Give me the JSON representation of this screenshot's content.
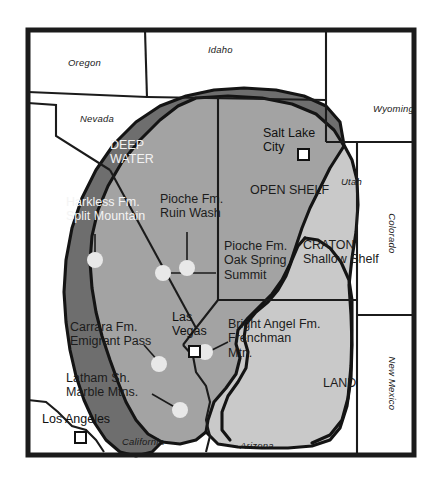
{
  "map": {
    "title": "Cambrian paleogeographic map of the southwestern United States",
    "frame": {
      "border_color": "#1b1b1b",
      "background": "#ffffff"
    },
    "colors": {
      "deep_water": "#6e6e6e",
      "open_shelf": "#a3a3a3",
      "craton_shallow_shelf": "#c9c9c9",
      "land": "#9a9a9a",
      "outline": "#141414",
      "dot_fill": "#e8e8e8",
      "state_line": "#1b1b1b",
      "paper": "#ffffff"
    },
    "states": [
      {
        "name": "Oregon",
        "orientation": "horizontal"
      },
      {
        "name": "Idaho",
        "orientation": "horizontal"
      },
      {
        "name": "Nevada",
        "orientation": "horizontal"
      },
      {
        "name": "Wyoming",
        "orientation": "horizontal"
      },
      {
        "name": "Utah",
        "orientation": "horizontal"
      },
      {
        "name": "Colorado",
        "orientation": "vertical"
      },
      {
        "name": "New Mexico",
        "orientation": "vertical"
      },
      {
        "name": "California",
        "orientation": "horizontal"
      },
      {
        "name": "Arizona",
        "orientation": "horizontal"
      }
    ],
    "facies_regions": [
      {
        "id": "deep-water",
        "label": "DEEP\nWATER",
        "text_color": "light"
      },
      {
        "id": "open-shelf",
        "label": "OPEN SHELF",
        "text_color": "dark"
      },
      {
        "id": "craton",
        "label": "CRATON\nShallow Shelf",
        "text_color": "dark"
      },
      {
        "id": "land",
        "label": "LAND",
        "text_color": "dark"
      }
    ],
    "cities": [
      {
        "name": "Salt Lake\nCity",
        "marker": "square-city-marker"
      },
      {
        "name": "Las\nVegas",
        "marker": "square-city-marker"
      },
      {
        "name": "Los Angeles",
        "marker": "square-city-marker"
      }
    ],
    "localities": [
      {
        "id": "harkless",
        "label": "Harkless Fm.\nSplit Mountain",
        "text_color": "light"
      },
      {
        "id": "pioche-ruin",
        "label": "Pioche Fm.\nRuin Wash",
        "text_color": "dark"
      },
      {
        "id": "pioche-oak",
        "label": "Pioche Fm.\nOak Spring\nSummit",
        "text_color": "dark"
      },
      {
        "id": "bright-angel",
        "label": "Bright Angel Fm.\nFrenchman\nMtn.",
        "text_color": "dark"
      },
      {
        "id": "carrara",
        "label": "Carrara Fm.\nEmigrant Pass",
        "text_color": "dark"
      },
      {
        "id": "latham",
        "label": "Latham Sh.\nMarble Mtns.",
        "text_color": "dark"
      }
    ]
  }
}
